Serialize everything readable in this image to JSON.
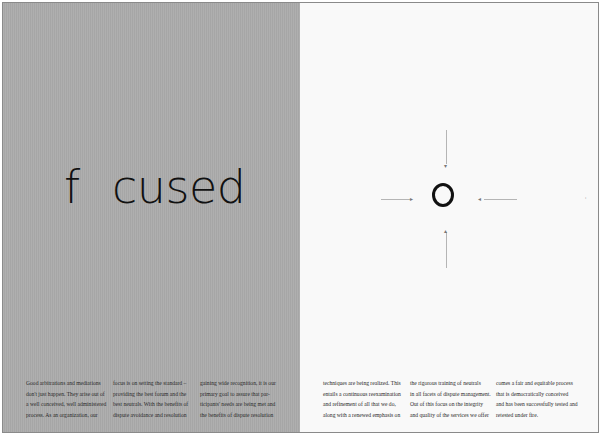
{
  "spread": {
    "colors": {
      "left_page": "#ababab",
      "right_page": "#f9f9f9",
      "text": "#111111",
      "guide_lines": "#b5b5b5"
    },
    "headline": {
      "part1": "f",
      "part2": "cused",
      "o_letter": "O"
    },
    "arrows": {
      "top": "▾",
      "bottom": "▴",
      "left": "▸",
      "right": "◂"
    },
    "margin_mark": "'",
    "columns": [
      {
        "lines": [
          "Good arbitrations and mediations",
          "don't just happen. They arise out of",
          "a well conceived, well administered",
          "process. As an organization, our"
        ]
      },
      {
        "lines": [
          "focus is on setting the standard –",
          "providing the best forum and the",
          "best neutrals. With the benefits of",
          "dispute avoidance and resolution"
        ]
      },
      {
        "lines": [
          "gaining wide recognition, it is our",
          "primary goal to assure that par-",
          "ticipants' needs are being met and",
          "the benefits of dispute resolution"
        ]
      },
      {
        "lines": [
          "techniques are being realized. This",
          "entails a continuous reexamination",
          "and refinement of all that we do,",
          "along with a renewed emphasis on"
        ]
      },
      {
        "lines": [
          "the rigorous training of neutrals",
          "in all facets of dispute management.",
          "Out of this focus on the integrity",
          "and quality of the services we offer"
        ]
      },
      {
        "lines": [
          "comes a fair and equitable process",
          "that is democratically conceived",
          "and has been successfully tested and",
          "retested under fire."
        ]
      }
    ]
  }
}
